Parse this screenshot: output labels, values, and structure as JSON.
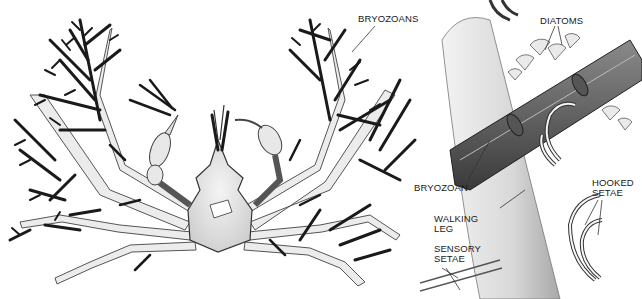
{
  "figure": {
    "left_panel": {
      "subject": "decorator crab covered in bryozoans",
      "labels": [
        {
          "id": "bryozoans",
          "text": "BRYOZOANS"
        }
      ]
    },
    "right_panel": {
      "subject": "close-up of walking leg with hooked setae holding bryozoan",
      "labels": [
        {
          "id": "diatoms",
          "text": "DIATOMS"
        },
        {
          "id": "bryozoan",
          "text": "BRYOZOAN"
        },
        {
          "id": "walking_leg",
          "text": "WALKING\nLEG"
        },
        {
          "id": "hooked_setae",
          "text": "HOOKED\nSETAE"
        },
        {
          "id": "sensory_setae",
          "text": "SENSORY\nSETAE"
        }
      ]
    },
    "colors": {
      "ink": "#1a1a1a",
      "shell": "#e6e6e6",
      "leg_fill": "#ececec",
      "stipple": "#bdbdbd",
      "background": "#ffffff"
    }
  }
}
